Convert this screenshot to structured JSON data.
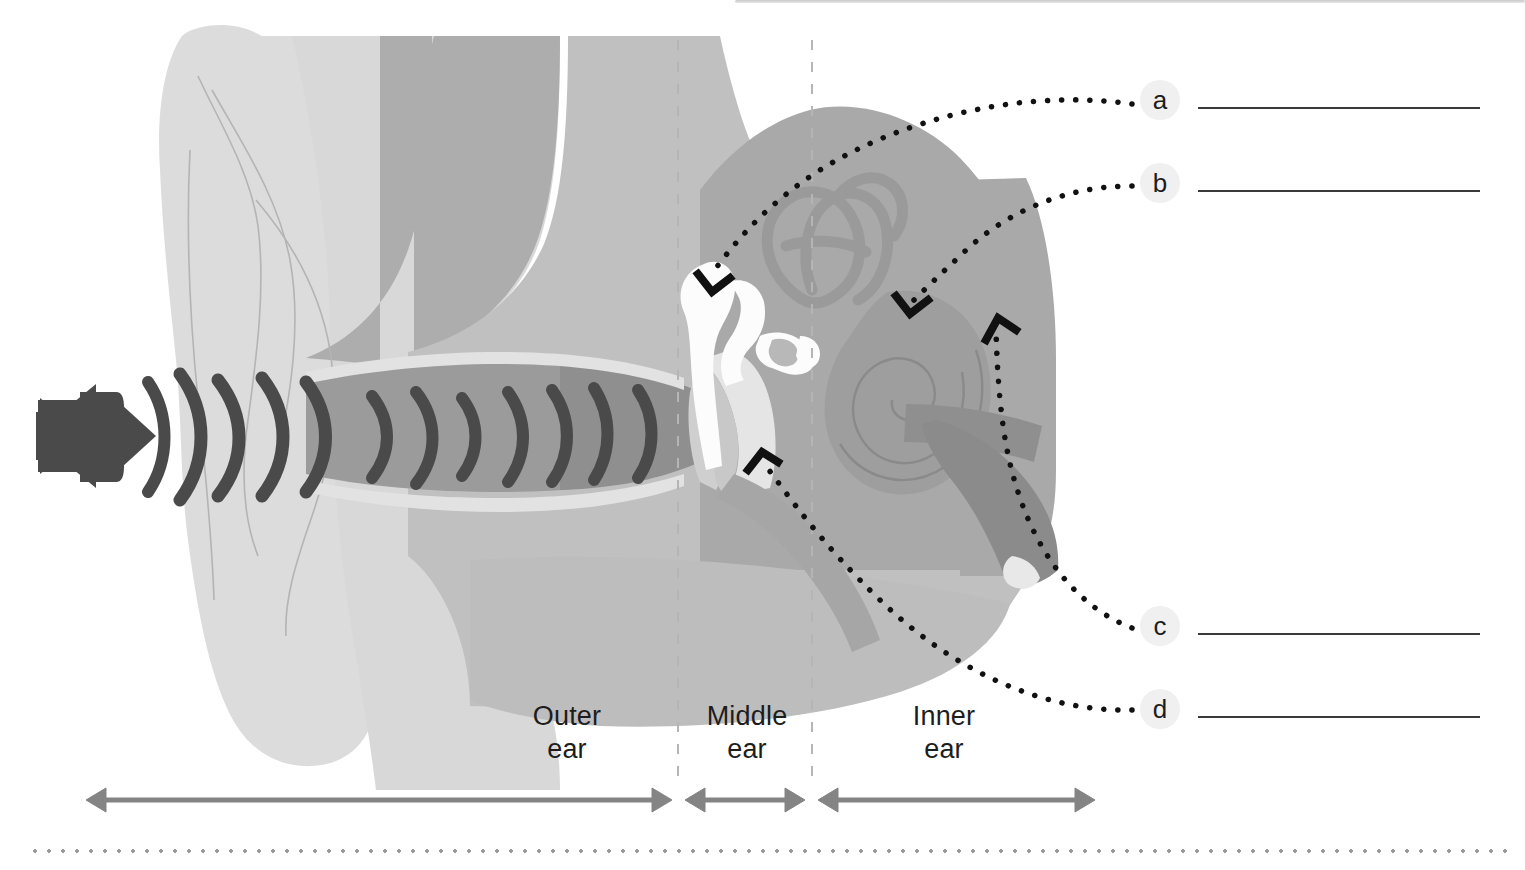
{
  "diagram": {
    "title_alt": "Cross-section of the human ear",
    "regions": [
      {
        "id": "outer",
        "label": "Outer\near"
      },
      {
        "id": "middle",
        "label": "Middle\near"
      },
      {
        "id": "inner",
        "label": "Inner\near"
      }
    ],
    "answer_rows": [
      {
        "key": "a",
        "letter": "a",
        "value": ""
      },
      {
        "key": "b",
        "letter": "b",
        "value": ""
      },
      {
        "key": "c",
        "letter": "c",
        "value": ""
      },
      {
        "key": "d",
        "letter": "d",
        "value": ""
      }
    ],
    "icons": {
      "speaker": "speaker-icon",
      "sound_waves": "sound-wave-icon"
    },
    "colors": {
      "pinna": "#dcdcdc",
      "head_light": "#d0d0d0",
      "head_mid": "#adadad",
      "canal": "#9b9b9b",
      "canal_dark": "#8d8d8d",
      "inner_block": "#a9a9a9",
      "cochlea": "#9a9a9a",
      "bone_white": "#fdfdfd",
      "eardrum": "#c4c4c4",
      "nerve": "#8a8a8a",
      "wave_dark": "#4a4a4a",
      "speaker": "#4a4a4a",
      "leader_dot": "#111111",
      "divider": "#b5b5b5",
      "arrow": "#848484",
      "badge_bg": "#f0f0f0",
      "answer_line": "#3a3a3a",
      "bottom_dots": "#9a9a9a"
    },
    "dividers": [
      {
        "id": "outer-middle",
        "x": 678
      },
      {
        "id": "middle-inner",
        "x": 812
      }
    ],
    "scale_arrows": [
      {
        "id": "outer-span",
        "x1": 85,
        "x2": 672,
        "heads": "both"
      },
      {
        "id": "middle-span",
        "x1": 684,
        "x2": 806,
        "heads": "both"
      },
      {
        "id": "inner-span",
        "x1": 818,
        "x2": 1095,
        "heads": "both"
      }
    ]
  }
}
